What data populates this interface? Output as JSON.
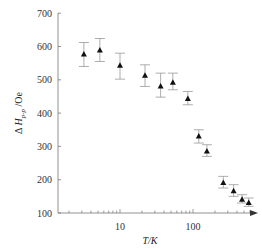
{
  "chart_data": {
    "type": "scatter",
    "title": "",
    "xlabel": "T/K",
    "ylabel": "ΔH_p-p /Oe",
    "ylabel_main": "Δ H",
    "ylabel_sub": "p-p",
    "ylabel_unit": "/Oe",
    "xscale": "log",
    "xlim": [
      1.4,
      800
    ],
    "ylim": [
      100,
      700
    ],
    "yticks": [
      100,
      200,
      300,
      400,
      500,
      600,
      700
    ],
    "xticks_labeled": [
      10,
      100
    ],
    "grid": false,
    "legend": null,
    "marker": "filled-triangle",
    "error_bars": true,
    "series": [
      {
        "name": "ΔHp-p",
        "x": [
          3.2,
          5.3,
          10,
          22,
          36,
          53,
          85,
          120,
          155,
          260,
          360,
          470,
          580
        ],
        "y": [
          576,
          588,
          542,
          512,
          480,
          491,
          442,
          330,
          285,
          190,
          165,
          140,
          130
        ],
        "err_low": [
          540,
          555,
          502,
          480,
          448,
          470,
          425,
          310,
          270,
          175,
          150,
          130,
          120
        ],
        "err_high": [
          612,
          624,
          580,
          545,
          520,
          520,
          465,
          350,
          305,
          210,
          185,
          155,
          145
        ]
      }
    ]
  },
  "labels": {
    "ytick_labels": [
      "100",
      "200",
      "300",
      "400",
      "500",
      "600",
      "700"
    ],
    "xtick_labels": [
      "10",
      "100"
    ],
    "xlabel": "T/K"
  }
}
